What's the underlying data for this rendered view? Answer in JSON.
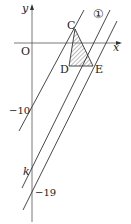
{
  "diagram": {
    "axes": {
      "x_label": "x",
      "y_label": "y",
      "origin_label": "O"
    },
    "points": {
      "C": "C",
      "D": "D",
      "E": "E"
    },
    "line_label": "①",
    "y_ticks": {
      "minus10": "−10",
      "k": "k",
      "minus19": "−19"
    },
    "colors": {
      "line": "#333333",
      "hatch": "#555555",
      "background": "#ffffff"
    }
  }
}
